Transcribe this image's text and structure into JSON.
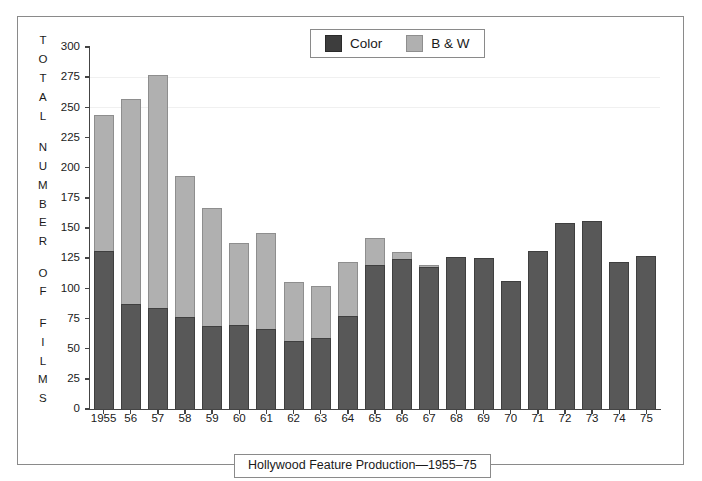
{
  "chart_data": {
    "type": "bar",
    "subtype": "stacked-vertical",
    "title": "Hollywood Feature Production—1955–75",
    "xlabel": "",
    "ylabel": "TOTAL NUMBER OF FILMS",
    "ylim": [
      0,
      300
    ],
    "yticks": [
      0,
      25,
      50,
      75,
      100,
      125,
      150,
      175,
      200,
      225,
      250,
      275,
      300
    ],
    "ytick_labels": [
      "0",
      "25",
      "50",
      "75",
      "100",
      "125",
      "150",
      "175",
      "200",
      "225",
      "250",
      "275",
      "300"
    ],
    "grid": "faint horizontal lines at 250 and 275",
    "legend": {
      "position": "top-center",
      "entries": [
        {
          "label": "Color",
          "color": "#3d3d3d"
        },
        {
          "label": "B & W",
          "color": "#b0b0b0"
        }
      ]
    },
    "categories": [
      "1955",
      "56",
      "57",
      "58",
      "59",
      "60",
      "61",
      "62",
      "63",
      "64",
      "65",
      "66",
      "67",
      "68",
      "69",
      "70",
      "71",
      "72",
      "73",
      "74",
      "75"
    ],
    "series": [
      {
        "name": "Color",
        "color": "#585858",
        "values": [
          131,
          87,
          84,
          76,
          69,
          70,
          66,
          56,
          59,
          77,
          119,
          124,
          118,
          126,
          125,
          106,
          131,
          154,
          156,
          122,
          127
        ]
      },
      {
        "name": "B & W",
        "color": "#b0b0b0",
        "values": [
          113,
          170,
          193,
          117,
          98,
          68,
          80,
          49,
          43,
          45,
          23,
          6,
          1,
          0,
          0,
          0,
          0,
          0,
          0,
          0,
          0
        ]
      }
    ],
    "totals": [
      244,
      257,
      277,
      193,
      167,
      138,
      146,
      105,
      102,
      122,
      142,
      130,
      119,
      126,
      125,
      106,
      131,
      154,
      156,
      122,
      127
    ]
  },
  "ylabel_letters": [
    "T",
    "O",
    "T",
    "A",
    "L",
    "",
    "N",
    "U",
    "M",
    "B",
    "E",
    "R",
    "",
    "O",
    "F",
    "",
    "F",
    "I",
    "L",
    "M",
    "S"
  ],
  "colors": {
    "color_fill": "#585858",
    "bw_fill": "#b0b0b0",
    "axis": "#444444",
    "frame": "#8a8a8a",
    "background": "#ffffff",
    "gridline": "#f0f0f0"
  }
}
